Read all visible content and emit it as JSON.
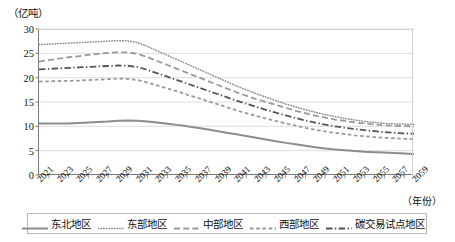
{
  "chart_data": {
    "type": "line",
    "title": "",
    "xlabel": "（年份）",
    "ylabel": "（亿吨）",
    "ylim": [
      0,
      30
    ],
    "yticks": [
      0,
      5,
      10,
      15,
      20,
      25,
      30
    ],
    "xlim": [
      2021,
      2059
    ],
    "grid": true,
    "legend_position": "bottom",
    "x": [
      2021,
      2022,
      2023,
      2024,
      2025,
      2026,
      2027,
      2028,
      2029,
      2030,
      2031,
      2032,
      2033,
      2034,
      2035,
      2036,
      2037,
      2038,
      2039,
      2040,
      2041,
      2042,
      2043,
      2044,
      2045,
      2046,
      2047,
      2048,
      2049,
      2050,
      2051,
      2052,
      2053,
      2054,
      2055,
      2056,
      2057,
      2058,
      2059
    ],
    "xtick_labels": [
      "2021",
      "2023",
      "2025",
      "2027",
      "2029",
      "2031",
      "2033",
      "2035",
      "2037",
      "2039",
      "2041",
      "2043",
      "2045",
      "2047",
      "2049",
      "2051",
      "2053",
      "2055",
      "2057",
      "2059"
    ],
    "series": [
      {
        "name": "东北地区",
        "style": "solid",
        "color": "#8c8c8c",
        "values": [
          10.6,
          10.6,
          10.6,
          10.6,
          10.7,
          10.8,
          10.9,
          11.0,
          11.15,
          11.2,
          11.15,
          11.0,
          10.8,
          10.55,
          10.3,
          10.0,
          9.7,
          9.4,
          9.05,
          8.7,
          8.35,
          8.0,
          7.65,
          7.3,
          6.95,
          6.6,
          6.3,
          6.0,
          5.7,
          5.45,
          5.25,
          5.1,
          4.95,
          4.8,
          4.7,
          4.6,
          4.5,
          4.4,
          4.3
        ]
      },
      {
        "name": "东部地区",
        "style": "dotted",
        "color": "#8c8c8c",
        "values": [
          26.8,
          26.9,
          27.0,
          27.1,
          27.2,
          27.3,
          27.4,
          27.5,
          27.6,
          27.55,
          27.2,
          26.4,
          25.5,
          24.6,
          23.7,
          22.8,
          21.9,
          21.0,
          20.1,
          19.2,
          18.3,
          17.5,
          16.7,
          16.0,
          15.3,
          14.6,
          14.0,
          13.4,
          12.9,
          12.4,
          12.0,
          11.6,
          11.3,
          11.0,
          10.8,
          10.6,
          10.5,
          10.45,
          10.4
        ]
      },
      {
        "name": "中部地区",
        "style": "dashed",
        "color": "#9a9a9a",
        "values": [
          23.3,
          23.6,
          23.9,
          24.2,
          24.4,
          24.7,
          24.9,
          25.1,
          25.2,
          25.2,
          24.9,
          24.2,
          23.4,
          22.6,
          21.8,
          21.0,
          20.2,
          19.4,
          18.6,
          17.8,
          17.0,
          16.3,
          15.6,
          15.0,
          14.4,
          13.8,
          13.2,
          12.7,
          12.2,
          11.8,
          11.4,
          11.1,
          10.8,
          10.6,
          10.4,
          10.2,
          10.1,
          10.05,
          10.0
        ]
      },
      {
        "name": "西部地区",
        "style": "smalldash",
        "color": "#9a9a9a",
        "values": [
          19.2,
          19.25,
          19.3,
          19.35,
          19.4,
          19.5,
          19.6,
          19.7,
          19.8,
          19.75,
          19.5,
          19.0,
          18.4,
          17.8,
          17.2,
          16.5,
          15.9,
          15.25,
          14.6,
          13.95,
          13.3,
          12.7,
          12.15,
          11.6,
          11.1,
          10.6,
          10.15,
          9.7,
          9.3,
          8.95,
          8.65,
          8.4,
          8.15,
          7.95,
          7.8,
          7.65,
          7.55,
          7.45,
          7.4
        ]
      },
      {
        "name": "碳交易试点地区",
        "style": "dashdot",
        "color": "#555555",
        "values": [
          21.7,
          21.8,
          21.9,
          22.0,
          22.1,
          22.2,
          22.3,
          22.4,
          22.5,
          22.45,
          22.2,
          21.6,
          20.9,
          20.2,
          19.5,
          18.8,
          18.1,
          17.4,
          16.7,
          16.0,
          15.3,
          14.65,
          14.0,
          13.4,
          12.8,
          12.25,
          11.7,
          11.2,
          10.75,
          10.35,
          10.0,
          9.7,
          9.45,
          9.2,
          9.0,
          8.8,
          8.65,
          8.55,
          8.5
        ]
      }
    ],
    "legend": [
      {
        "label": "东北地区",
        "style": "solid",
        "color": "#8c8c8c"
      },
      {
        "label": "东部地区",
        "style": "dotted",
        "color": "#8c8c8c"
      },
      {
        "label": "中部地区",
        "style": "dashed",
        "color": "#9a9a9a"
      },
      {
        "label": "西部地区",
        "style": "smalldash",
        "color": "#9a9a9a"
      },
      {
        "label": "碳交易试点地区",
        "style": "dashdot",
        "color": "#555555"
      }
    ]
  }
}
